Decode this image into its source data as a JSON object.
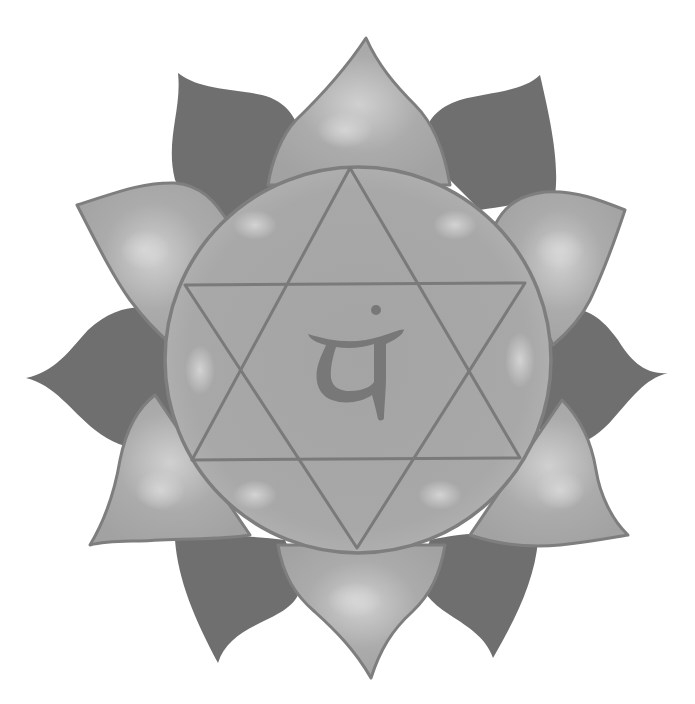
{
  "image": {
    "title": "Anahata heart chakra symbol",
    "description": "Grayscale lotus with twelve petals surrounding a circle containing a six-pointed star (hexagram) and a central glyph with a dot",
    "center_glyph": "यं",
    "petal_count": 12
  },
  "colors": {
    "background": "#ffffff",
    "dark_petal": "#6f6f6f",
    "light_petal": "#a9a9a9",
    "light_petal_highlight": "#cdcdcd",
    "outline": "#7e7e7e",
    "circle_fill": "#a6a6a6",
    "circle_highlight": "#c4c4c4",
    "star_line": "#7a7a7a",
    "glyph": "#787878"
  }
}
